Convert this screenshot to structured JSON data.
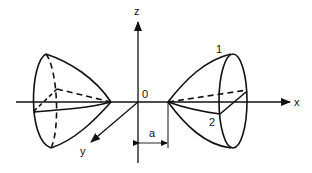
{
  "diagram": {
    "type": "3d-axes-with-paraboloids",
    "axes": {
      "x_label": "x",
      "y_label": "y",
      "z_label": "z",
      "origin_label": "0"
    },
    "dimension": {
      "label": "a"
    },
    "right_paraboloid": {
      "curve_labels": [
        "1",
        "2"
      ]
    },
    "colors": {
      "stroke": "#111111",
      "background": "#ffffff"
    }
  }
}
